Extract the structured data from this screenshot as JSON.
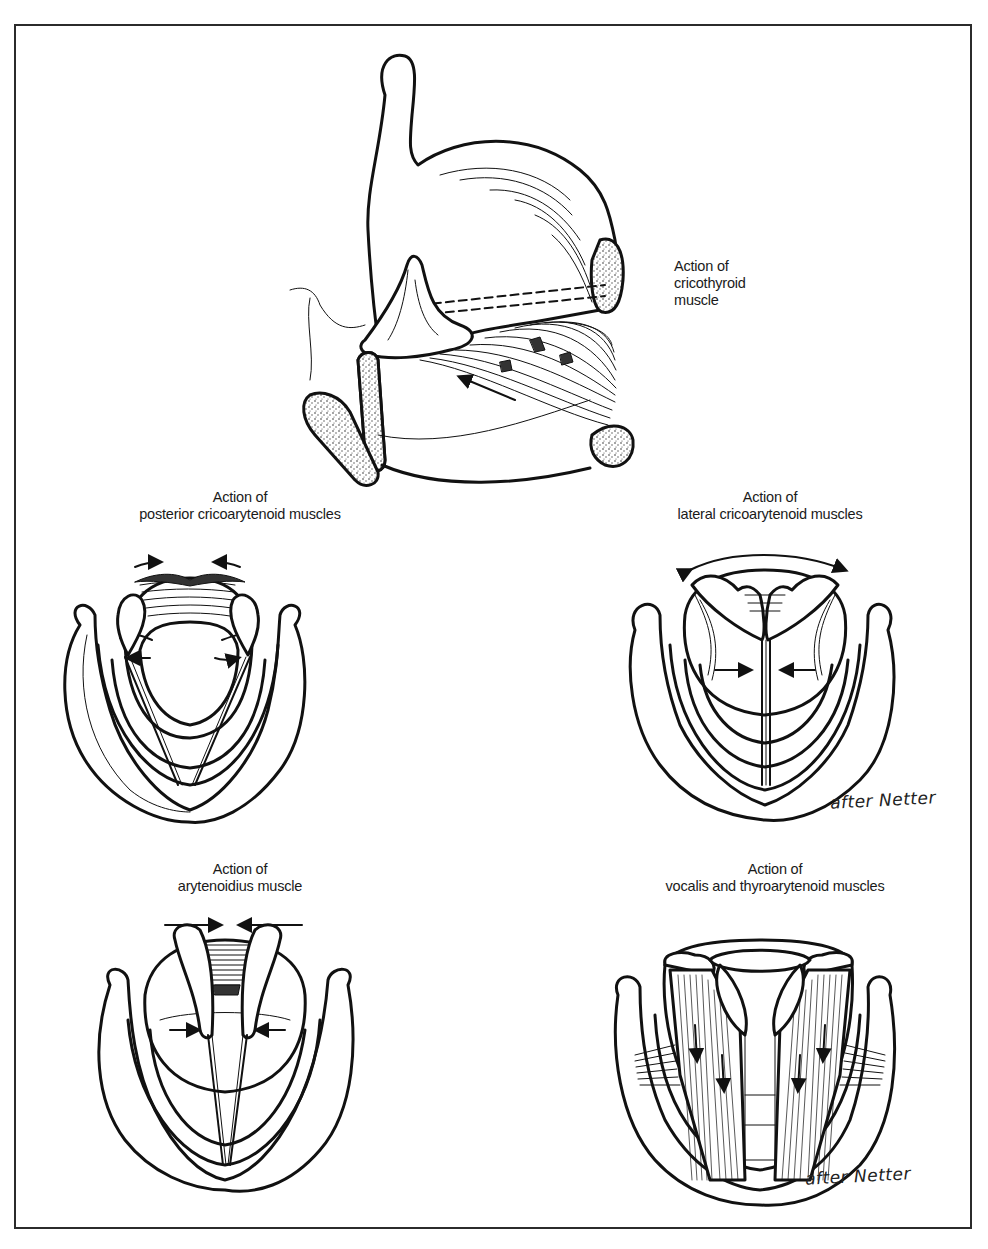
{
  "figure": {
    "frame": {
      "border_color": "#2b2b2b",
      "background": "#ffffff"
    },
    "panels": [
      {
        "id": "cricothyroid",
        "title_line1": "Action of",
        "title_line2": "cricothyroid",
        "title_line3": "muscle",
        "view": "lateral",
        "arrows": [
          "anterior-upward pull of cricoid arch toward thyroid"
        ]
      },
      {
        "id": "posterior-cricoarytenoid",
        "title_line1": "Action of",
        "title_line2": "posterior cricoarytenoid muscles",
        "view": "superior",
        "arrows": [
          "vocal processes rotate outward (abduction)"
        ]
      },
      {
        "id": "lateral-cricoarytenoid",
        "title_line1": "Action of",
        "title_line2": "lateral cricoarytenoid muscles",
        "view": "superior",
        "arrows": [
          "vocal processes rotate inward (adduction)"
        ],
        "signature": "after Netter"
      },
      {
        "id": "arytenoidius",
        "title_line1": "Action of",
        "title_line2": "arytenoidius muscle",
        "view": "superior",
        "arrows": [
          "arytenoids drawn together"
        ]
      },
      {
        "id": "vocalis-thyroarytenoid",
        "title_line1": "Action of",
        "title_line2": "vocalis and thyroarytenoid muscles",
        "view": "superior",
        "arrows": [
          "arytenoids drawn forward, cords shortened"
        ],
        "signature": "after Netter"
      }
    ]
  }
}
